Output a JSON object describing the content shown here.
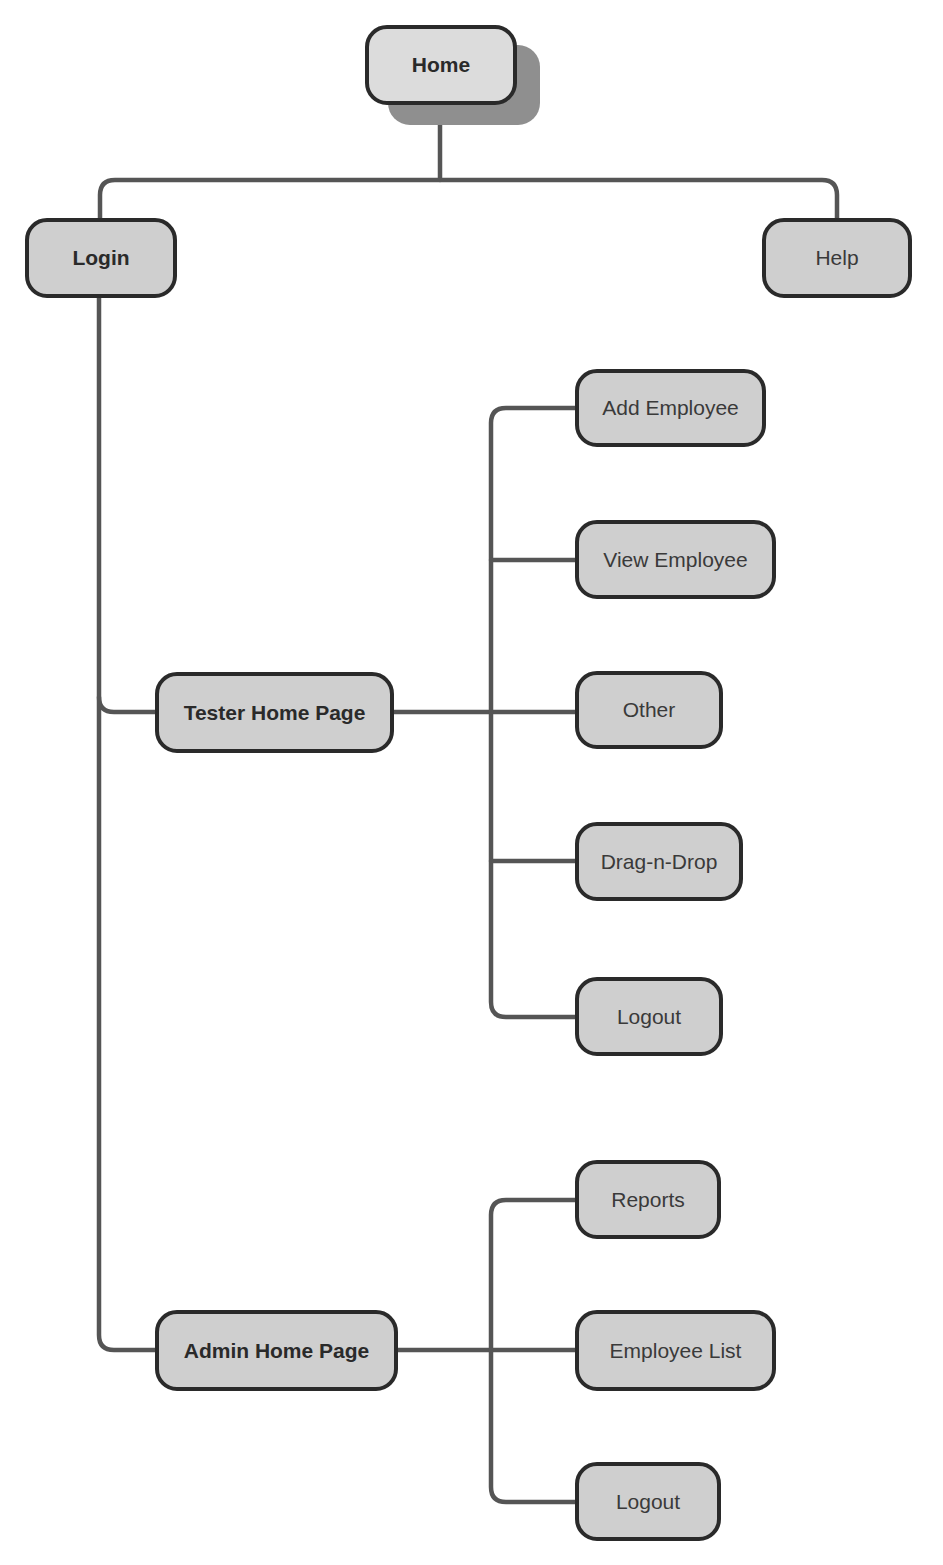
{
  "diagram": {
    "colors": {
      "node_fill": "#cfcfcf",
      "root_fill": "#dcdcdc",
      "node_border": "#2a2a2a",
      "connector": "#555555",
      "shadow": "#8f8f8f"
    },
    "nodes": {
      "home": "Home",
      "login": "Login",
      "help": "Help",
      "tester_home": "Tester Home Page",
      "add_employee": "Add Employee",
      "view_employee": "View Employee",
      "other": "Other",
      "drag_n_drop": "Drag-n-Drop",
      "tester_logout": "Logout",
      "admin_home": "Admin Home Page",
      "reports": "Reports",
      "employee_list": "Employee List",
      "admin_logout": "Logout"
    },
    "edges": [
      [
        "Home",
        "Login"
      ],
      [
        "Home",
        "Help"
      ],
      [
        "Login",
        "Tester Home Page"
      ],
      [
        "Login",
        "Admin Home Page"
      ],
      [
        "Tester Home Page",
        "Add Employee"
      ],
      [
        "Tester Home Page",
        "View Employee"
      ],
      [
        "Tester Home Page",
        "Other"
      ],
      [
        "Tester Home Page",
        "Drag-n-Drop"
      ],
      [
        "Tester Home Page",
        "Logout"
      ],
      [
        "Admin Home Page",
        "Reports"
      ],
      [
        "Admin Home Page",
        "Employee List"
      ],
      [
        "Admin Home Page",
        "Logout"
      ]
    ]
  }
}
